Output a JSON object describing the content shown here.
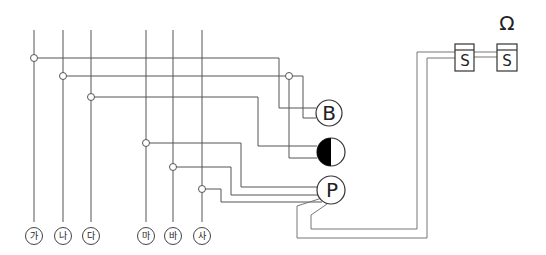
{
  "diagram": {
    "terminals": [
      {
        "label": "가",
        "x": 34,
        "junction_y": 58
      },
      {
        "label": "나",
        "x": 63,
        "junction_y": 76
      },
      {
        "label": "다",
        "x": 91,
        "junction_y": 97
      },
      {
        "label": "마",
        "x": 146,
        "junction_y": 143
      },
      {
        "label": "바",
        "x": 173,
        "junction_y": 167
      },
      {
        "label": "사",
        "x": 202,
        "junction_y": 189
      }
    ],
    "components": {
      "buzzer": {
        "label": "B",
        "name": "buzzer"
      },
      "lamp": {
        "label": "",
        "name": "pilot-lamp"
      },
      "push_button": {
        "label": "P",
        "name": "pressure-switch"
      },
      "switch1": {
        "label": "S"
      },
      "switch2": {
        "label": "S"
      },
      "omega": {
        "label": "Ω"
      }
    },
    "colors": {
      "line": "#555555",
      "fill": "#000000"
    }
  }
}
